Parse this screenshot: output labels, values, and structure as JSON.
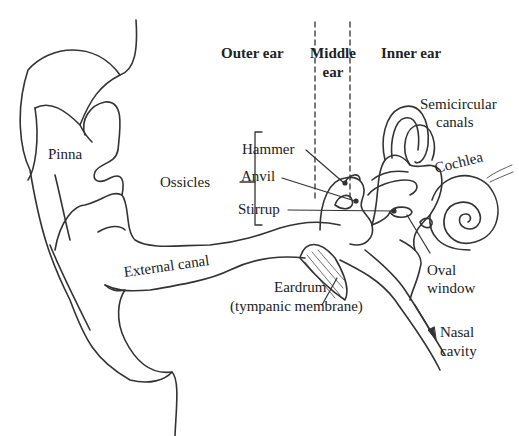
{
  "diagram": {
    "regions": {
      "outer": "Outer ear",
      "middle_1": "Middle",
      "middle_2": "ear",
      "inner": "Inner ear"
    },
    "labels": {
      "pinna": "Pinna",
      "ossicles": "Ossicles",
      "hammer": "Hammer",
      "anvil": "Anvil",
      "stirrup": "Stirrup",
      "semicircular_1": "Semicircular",
      "semicircular_2": "canals",
      "cochlea": "Cochlea",
      "external_canal": "External canal",
      "eardrum_1": "Eardrum",
      "eardrum_2": "(tympanic membrane)",
      "oval_1": "Oval",
      "oval_2": "window",
      "nasal_1": "Nasal",
      "nasal_2": "cavity"
    },
    "colors": {
      "line": "#333333",
      "text": "#222222",
      "background": "#ffffff"
    }
  }
}
